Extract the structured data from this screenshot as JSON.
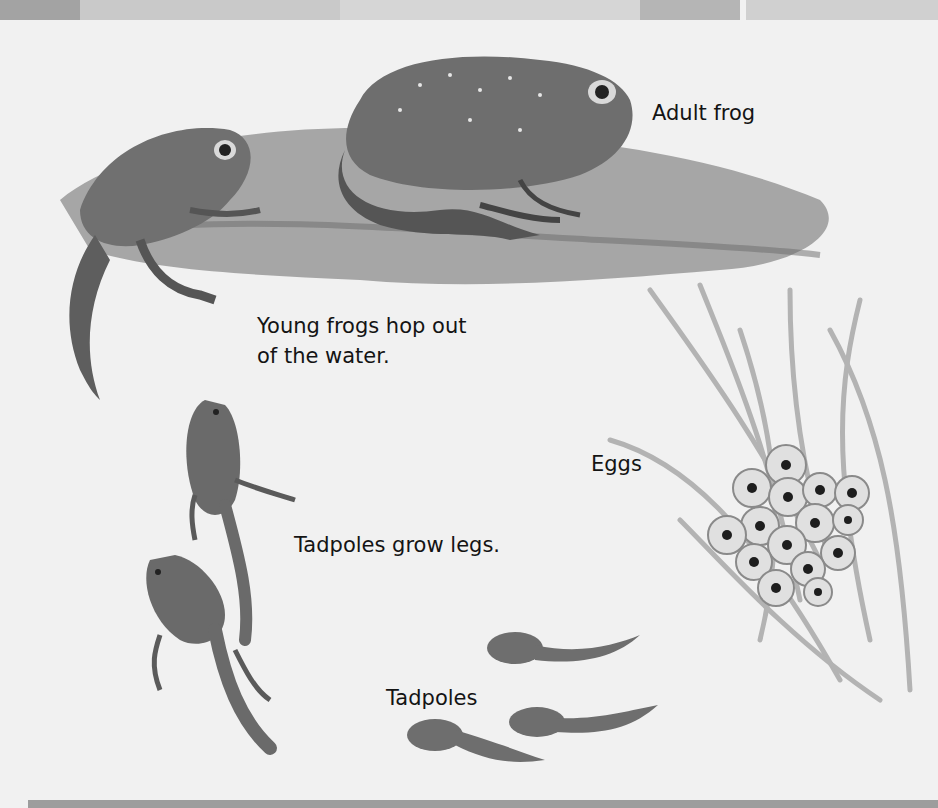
{
  "diagram": {
    "type": "life-cycle",
    "subject": "frog",
    "stages": [
      {
        "id": "adult-frog",
        "label": "Adult frog"
      },
      {
        "id": "eggs",
        "label": "Eggs"
      },
      {
        "id": "tadpoles",
        "label": "Tadpoles"
      },
      {
        "id": "tadpoles-grow-legs",
        "label": "Tadpoles grow legs."
      },
      {
        "id": "young-frogs",
        "label_line1": "Young frogs hop out",
        "label_line2": "of the water."
      }
    ]
  },
  "colors": {
    "background": "#f1f1f1",
    "frog_body": "#6e6e6e",
    "frog_dark": "#3a3a3a",
    "ground": "#8a8a8a",
    "weed": "#b8b8b8",
    "egg": "#dcdcdc",
    "border": "#a9a9a9"
  }
}
